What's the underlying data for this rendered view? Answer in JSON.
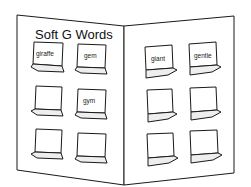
{
  "title": "Soft G Words",
  "left_page": {
    "pockets": [
      {
        "word": "giraffe"
      },
      {
        "word": "gem"
      },
      {
        "word": ""
      },
      {
        "word": "gym"
      },
      {
        "word": ""
      },
      {
        "word": ""
      }
    ]
  },
  "right_page": {
    "pockets": [
      {
        "word": "giant"
      },
      {
        "word": "gentle"
      },
      {
        "word": ""
      },
      {
        "word": ""
      },
      {
        "word": ""
      },
      {
        "word": ""
      }
    ]
  },
  "colors": {
    "line": "#1a1a1a",
    "card": "#ffffff",
    "shade": "#e8e8e8"
  }
}
